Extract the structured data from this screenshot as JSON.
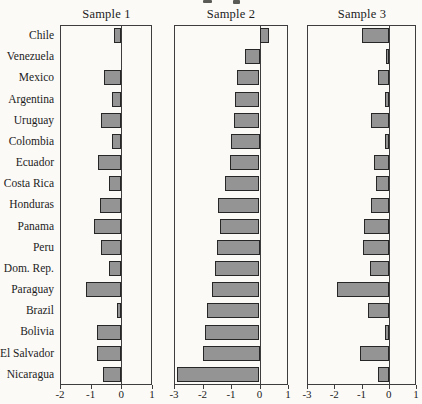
{
  "chart_data": {
    "type": "bar",
    "orientation": "horizontal",
    "title": "",
    "xlabel": "",
    "ylabel": "",
    "grid": false,
    "legend": "none",
    "bar_color": "#949494",
    "bar_border_color": "#262626",
    "axis_color": "#3d3d3d",
    "background": "#fbfaf7",
    "categories": [
      "Chile",
      "Venezuela",
      "Mexico",
      "Argentina",
      "Uruguay",
      "Colombia",
      "Ecuador",
      "Costa Rica",
      "Honduras",
      "Panama",
      "Peru",
      "Dom. Rep.",
      "Paraguay",
      "Brazil",
      "Bolivia",
      "El Salvador",
      "Nicaragua"
    ],
    "panels": [
      {
        "title": "Sample 1",
        "xlim": [
          -2,
          1
        ],
        "ticks": [
          -2,
          -1,
          0,
          1
        ],
        "tick_labels": [
          "-2",
          "-1",
          "0",
          "1"
        ],
        "values": [
          -0.25,
          0.0,
          -0.55,
          -0.3,
          -0.65,
          -0.3,
          -0.75,
          -0.4,
          -0.7,
          -0.9,
          -0.65,
          -0.4,
          -1.15,
          -0.15,
          -0.8,
          -0.8,
          -0.6
        ]
      },
      {
        "title": "Sample 2",
        "xlim": [
          -3,
          1
        ],
        "ticks": [
          -3,
          -2,
          -1,
          0,
          1
        ],
        "tick_labels": [
          "-3",
          "-2",
          "-1",
          "0",
          "1"
        ],
        "values": [
          0.35,
          -0.5,
          -0.8,
          -0.85,
          -0.9,
          -1.0,
          -1.05,
          -1.2,
          -1.45,
          -1.4,
          -1.5,
          -1.55,
          -1.65,
          -1.85,
          -1.9,
          -2.0,
          -2.9
        ]
      },
      {
        "title": "Sample 3",
        "xlim": [
          -3,
          1
        ],
        "ticks": [
          -3,
          -2,
          -1,
          0,
          1
        ],
        "tick_labels": [
          "-3",
          "-2",
          "-1",
          "0",
          "1"
        ],
        "values": [
          -1.0,
          -0.1,
          -0.4,
          -0.15,
          -0.65,
          -0.15,
          -0.55,
          -0.45,
          -0.65,
          -0.9,
          -0.95,
          -0.7,
          -1.9,
          -0.75,
          -0.15,
          -1.05,
          -0.4
        ]
      }
    ]
  }
}
